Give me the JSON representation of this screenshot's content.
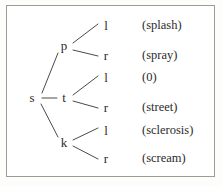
{
  "figure": {
    "type": "tree-diagram",
    "background_color": "#ffffff",
    "border_color": "#9b9b97",
    "text_color": "#2b2b2b",
    "line_color": "#4a4a4a"
  },
  "tree": {
    "root": {
      "label": "s",
      "x": 32,
      "y": 98
    },
    "internal_nodes": [
      {
        "label": "p",
        "x": 64,
        "y": 46
      },
      {
        "label": "t",
        "x": 64,
        "y": 98
      },
      {
        "label": "k",
        "x": 64,
        "y": 143
      }
    ],
    "branches": [
      {
        "label": "l",
        "x": 106,
        "y": 26,
        "gloss": "(splash)",
        "gloss_x": 142,
        "gloss_y": 26
      },
      {
        "label": "r",
        "x": 106,
        "y": 56,
        "gloss": "(spray)",
        "gloss_x": 142,
        "gloss_y": 56
      },
      {
        "label": "l",
        "x": 106,
        "y": 78,
        "gloss": "(0)",
        "gloss_x": 142,
        "gloss_y": 78
      },
      {
        "label": "r",
        "x": 106,
        "y": 108,
        "gloss": "(street)",
        "gloss_x": 142,
        "gloss_y": 108
      },
      {
        "label": "l",
        "x": 106,
        "y": 131,
        "gloss": "(sclerosis)",
        "gloss_x": 142,
        "gloss_y": 131
      },
      {
        "label": "r",
        "x": 106,
        "y": 159,
        "gloss": "(scream)",
        "gloss_x": 142,
        "gloss_y": 159
      }
    ],
    "edges": [
      {
        "from": "s",
        "to": "p",
        "x1": 42,
        "y1": 93,
        "x2": 58,
        "y2": 53
      },
      {
        "from": "s",
        "to": "t",
        "x1": 42,
        "y1": 98,
        "x2": 57,
        "y2": 98
      },
      {
        "from": "s",
        "to": "k",
        "x1": 41,
        "y1": 104,
        "x2": 58,
        "y2": 137
      },
      {
        "from": "p",
        "to": "l",
        "x1": 73,
        "y1": 43,
        "x2": 98,
        "y2": 24
      },
      {
        "from": "p",
        "to": "r",
        "x1": 73,
        "y1": 50,
        "x2": 98,
        "y2": 56
      },
      {
        "from": "t",
        "to": "l",
        "x1": 73,
        "y1": 95,
        "x2": 98,
        "y2": 76
      },
      {
        "from": "t",
        "to": "r",
        "x1": 73,
        "y1": 101,
        "x2": 98,
        "y2": 108
      },
      {
        "from": "k",
        "to": "l",
        "x1": 73,
        "y1": 140,
        "x2": 98,
        "y2": 128
      },
      {
        "from": "k",
        "to": "r",
        "x1": 73,
        "y1": 146,
        "x2": 98,
        "y2": 159
      }
    ]
  }
}
